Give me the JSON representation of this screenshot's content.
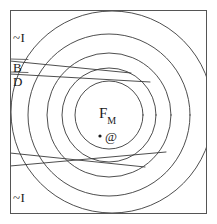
{
  "figure": {
    "width": 217,
    "height": 224,
    "background_color": "#ffffff",
    "stroke_color": "#3a3a3a",
    "frame_color": "#555555",
    "stroke_width": 0.9
  },
  "labels": {
    "not_i_top": "~I",
    "not_i_bottom": "~I",
    "b": "B",
    "d": "D",
    "f_main": "F",
    "f_subscript": "M",
    "at_symbol": "@"
  },
  "geometry": {
    "frame": {
      "x": 10,
      "y": 10,
      "width": 197,
      "height": 204
    },
    "circles": [
      {
        "name": "innermost-circle",
        "cx": 109,
        "cy": 115,
        "r": 34
      },
      {
        "name": "second-circle",
        "cx": 109,
        "cy": 115,
        "r": 47
      },
      {
        "name": "third-circle",
        "cx": 109,
        "cy": 115,
        "r": 62
      },
      {
        "name": "outer-circle",
        "cx": 109,
        "cy": 115,
        "r": 81
      }
    ],
    "left_arc": {
      "name": "not-i-boundary-arc",
      "cx": 112,
      "cy": 112,
      "r": 101
    },
    "lines": [
      {
        "name": "line-b",
        "x1": 10,
        "y1": 61,
        "x2": 131,
        "y2": 73
      },
      {
        "name": "line-d",
        "x1": 10,
        "y1": 74,
        "x2": 150,
        "y2": 82
      },
      {
        "name": "line-lower-1",
        "x1": 10,
        "y1": 153,
        "x2": 145,
        "y2": 167
      },
      {
        "name": "line-lower-2",
        "x1": 10,
        "y1": 166,
        "x2": 166,
        "y2": 152
      }
    ],
    "point_marker": {
      "name": "point-dot",
      "cx": 100,
      "cy": 136,
      "r": 1.6
    }
  }
}
